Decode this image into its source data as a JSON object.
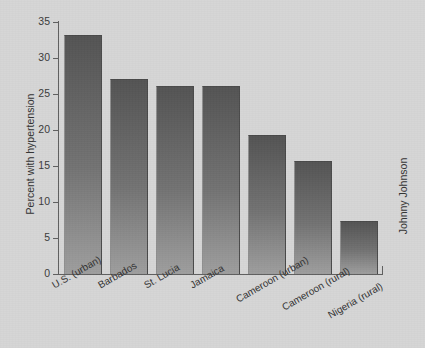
{
  "chart_data": {
    "type": "bar",
    "title": "",
    "subtitle": "",
    "xlabel": "",
    "ylabel": "Percent with hypertension",
    "categories": [
      "U.S. (urban)",
      "Barbados",
      "St. Lucia",
      "Jamaica",
      "Cameroon (urban)",
      "Cameroon (rural)",
      "Nigeria (rural)"
    ],
    "values": [
      33,
      27,
      26,
      26,
      19.2,
      15.5,
      7.2
    ],
    "ylim": [
      0,
      35
    ],
    "ytick_labels": [
      "35",
      "30",
      "25",
      "20",
      "15",
      "10",
      "5",
      "0"
    ],
    "ytick_values": [
      35,
      30,
      25,
      20,
      15,
      10,
      5,
      0
    ],
    "grid": false,
    "legend": false,
    "xtick_rotation_deg": -30
  },
  "credit": {
    "text": "Johnny Johnson"
  },
  "colors": {
    "background": "#d6d6d6",
    "axis": "#5f5f5f",
    "text": "#333333",
    "bar_top": "#545454",
    "bar_bottom": "#9e9e9e"
  }
}
